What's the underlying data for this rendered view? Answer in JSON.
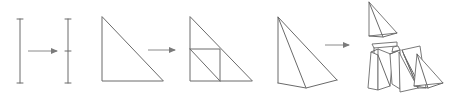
{
  "diagram": {
    "stroke_color": "#6a6a6a",
    "arrow_color": "#8a8a8a",
    "background": "#ffffff",
    "stages": [
      {
        "id": "segment",
        "label": "",
        "before": "line-segment",
        "after": "bisected-line-segment"
      },
      {
        "id": "triangle",
        "label": "",
        "before": "right-triangle",
        "after": "subdivided-right-triangle"
      },
      {
        "id": "pyramid",
        "label": "",
        "before": "tetrahedron",
        "after": "exploded-tetrahedron-pieces"
      }
    ],
    "arrows": [
      {
        "from": "line-segment",
        "to": "bisected-line-segment"
      },
      {
        "from": "right-triangle",
        "to": "subdivided-right-triangle"
      },
      {
        "from": "tetrahedron",
        "to": "exploded-tetrahedron-pieces"
      }
    ]
  }
}
